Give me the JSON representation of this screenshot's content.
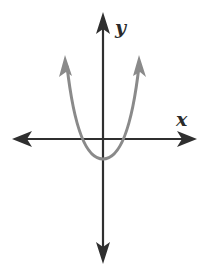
{
  "figure": {
    "type": "coordinate-plane-graph",
    "labels": {
      "x_axis": "x",
      "y_axis": "y"
    },
    "colors": {
      "axes": "#2f2f2f",
      "curve": "#8a8a8a",
      "background": "#ffffff"
    },
    "curve": {
      "kind": "parabola",
      "opens": "up",
      "vertex_px": [
        103,
        159
      ],
      "x_intercepts_px": [
        83,
        123
      ],
      "arrow_tips_px": [
        [
          65,
          57
        ],
        [
          139,
          57
        ]
      ]
    },
    "axes_px": {
      "origin": [
        103,
        139
      ],
      "x_axis": {
        "from": 13,
        "to": 196
      },
      "y_axis": {
        "from": 14,
        "to": 262
      }
    }
  }
}
